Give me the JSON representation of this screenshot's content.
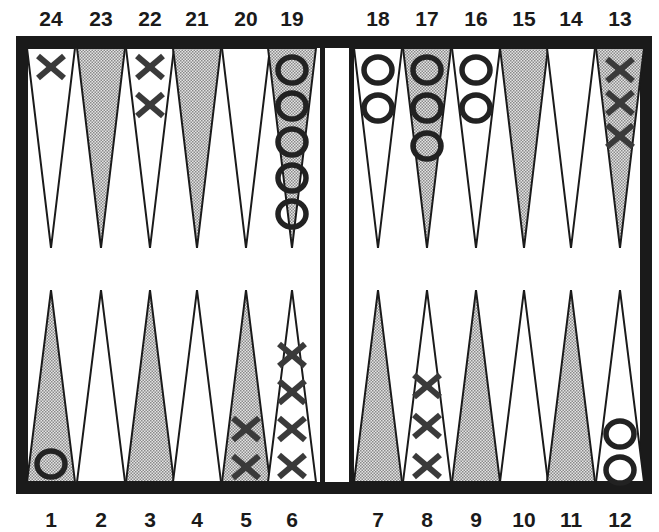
{
  "board": {
    "frame_color": "#1a1a1a",
    "light_point_color": "#ffffff",
    "shaded_point_color": "#c8c8c8",
    "checker_color": "#222222",
    "x_checker_color": "#3a3a3a"
  },
  "top_labels": [
    "24",
    "23",
    "22",
    "21",
    "20",
    "19",
    "18",
    "17",
    "16",
    "15",
    "14",
    "13"
  ],
  "bottom_labels": [
    "1",
    "2",
    "3",
    "4",
    "5",
    "6",
    "7",
    "8",
    "9",
    "10",
    "11",
    "12"
  ],
  "points": [
    {
      "number": 24,
      "row": "top",
      "shaded": false,
      "checker": "X",
      "count": 1
    },
    {
      "number": 23,
      "row": "top",
      "shaded": true,
      "checker": "",
      "count": 0
    },
    {
      "number": 22,
      "row": "top",
      "shaded": false,
      "checker": "X",
      "count": 2
    },
    {
      "number": 21,
      "row": "top",
      "shaded": true,
      "checker": "",
      "count": 0
    },
    {
      "number": 20,
      "row": "top",
      "shaded": false,
      "checker": "",
      "count": 0
    },
    {
      "number": 19,
      "row": "top",
      "shaded": true,
      "checker": "O",
      "count": 5
    },
    {
      "number": 18,
      "row": "top",
      "shaded": false,
      "checker": "O",
      "count": 2
    },
    {
      "number": 17,
      "row": "top",
      "shaded": true,
      "checker": "O",
      "count": 3
    },
    {
      "number": 16,
      "row": "top",
      "shaded": false,
      "checker": "O",
      "count": 2
    },
    {
      "number": 15,
      "row": "top",
      "shaded": true,
      "checker": "",
      "count": 0
    },
    {
      "number": 14,
      "row": "top",
      "shaded": false,
      "checker": "",
      "count": 0
    },
    {
      "number": 13,
      "row": "top",
      "shaded": true,
      "checker": "X",
      "count": 3
    },
    {
      "number": 1,
      "row": "bottom",
      "shaded": true,
      "checker": "O",
      "count": 1
    },
    {
      "number": 2,
      "row": "bottom",
      "shaded": false,
      "checker": "",
      "count": 0
    },
    {
      "number": 3,
      "row": "bottom",
      "shaded": true,
      "checker": "",
      "count": 0
    },
    {
      "number": 4,
      "row": "bottom",
      "shaded": false,
      "checker": "",
      "count": 0
    },
    {
      "number": 5,
      "row": "bottom",
      "shaded": true,
      "checker": "X",
      "count": 2
    },
    {
      "number": 6,
      "row": "bottom",
      "shaded": false,
      "checker": "X",
      "count": 4
    },
    {
      "number": 7,
      "row": "bottom",
      "shaded": true,
      "checker": "",
      "count": 0
    },
    {
      "number": 8,
      "row": "bottom",
      "shaded": false,
      "checker": "X",
      "count": 3
    },
    {
      "number": 9,
      "row": "bottom",
      "shaded": true,
      "checker": "",
      "count": 0
    },
    {
      "number": 10,
      "row": "bottom",
      "shaded": false,
      "checker": "",
      "count": 0
    },
    {
      "number": 11,
      "row": "bottom",
      "shaded": true,
      "checker": "",
      "count": 0
    },
    {
      "number": 12,
      "row": "bottom",
      "shaded": false,
      "checker": "O",
      "count": 2
    }
  ]
}
